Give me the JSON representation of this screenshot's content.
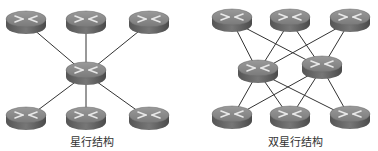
{
  "diagrams": [
    {
      "id": "star",
      "caption": "星行结构",
      "caption_pos": [
        92,
        133
      ],
      "nodes": [
        {
          "id": "t1",
          "x": 26,
          "y": 19
        },
        {
          "id": "t2",
          "x": 86,
          "y": 19
        },
        {
          "id": "t3",
          "x": 149,
          "y": 19
        },
        {
          "id": "c",
          "x": 86,
          "y": 70
        },
        {
          "id": "b1",
          "x": 26,
          "y": 115
        },
        {
          "id": "b2",
          "x": 86,
          "y": 115
        },
        {
          "id": "b3",
          "x": 149,
          "y": 115
        }
      ],
      "edges": [
        [
          "t1",
          "c"
        ],
        [
          "t2",
          "c"
        ],
        [
          "t3",
          "c"
        ],
        [
          "b1",
          "c"
        ],
        [
          "b2",
          "c"
        ],
        [
          "b3",
          "c"
        ]
      ]
    },
    {
      "id": "dual-star",
      "caption": "双星行结构",
      "caption_pos": [
        295,
        133
      ],
      "nodes": [
        {
          "id": "t1",
          "x": 232,
          "y": 17
        },
        {
          "id": "t2",
          "x": 290,
          "y": 17
        },
        {
          "id": "t3",
          "x": 350,
          "y": 17
        },
        {
          "id": "c1",
          "x": 258,
          "y": 68
        },
        {
          "id": "c2",
          "x": 322,
          "y": 64
        },
        {
          "id": "b1",
          "x": 232,
          "y": 114
        },
        {
          "id": "b2",
          "x": 290,
          "y": 114
        },
        {
          "id": "b3",
          "x": 350,
          "y": 114
        }
      ],
      "edges": [
        [
          "t1",
          "c1"
        ],
        [
          "t1",
          "c2"
        ],
        [
          "t2",
          "c1"
        ],
        [
          "t2",
          "c2"
        ],
        [
          "t3",
          "c1"
        ],
        [
          "t3",
          "c2"
        ],
        [
          "b1",
          "c1"
        ],
        [
          "b1",
          "c2"
        ],
        [
          "b2",
          "c1"
        ],
        [
          "b2",
          "c2"
        ],
        [
          "b3",
          "c1"
        ],
        [
          "b3",
          "c2"
        ]
      ]
    }
  ],
  "colors": {
    "router_top": "#8a8a8a",
    "router_side": "#5e5e5e",
    "router_arrows": "#e8e8e8",
    "edge": "#333333"
  }
}
